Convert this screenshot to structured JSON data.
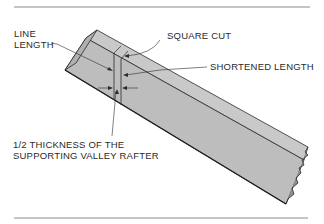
{
  "diagram": {
    "labels": {
      "line_length_1": "LINE",
      "line_length_2": "LENGTH",
      "square_cut": "SQUARE CUT",
      "shortened_length": "SHORTENED LENGTH",
      "half_thickness_1": "1/2 THICKNESS OF THE",
      "half_thickness_2": "SUPPORTING VALLEY RAFTER"
    },
    "colors": {
      "rafter_face": "#bdbdbd",
      "rafter_top": "#c9c9c9",
      "rafter_end": "#b0b0b0",
      "outline": "#2b2b2b",
      "rule": "#8a8a8a",
      "text": "#2a2a2a"
    }
  }
}
